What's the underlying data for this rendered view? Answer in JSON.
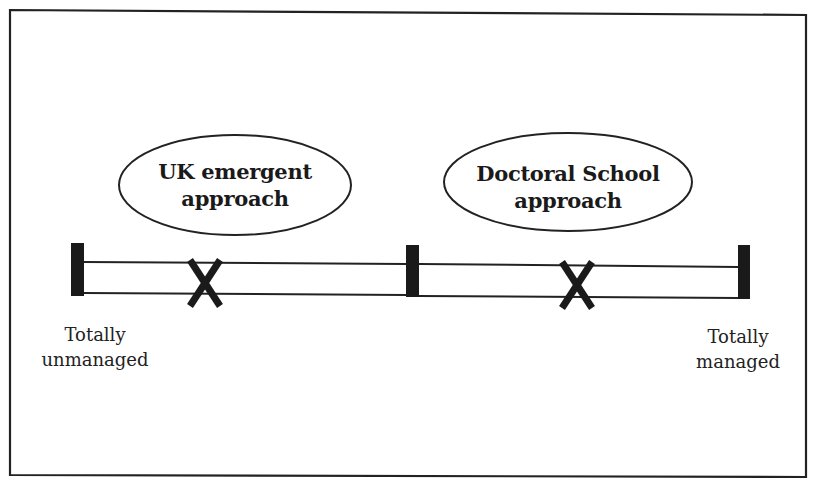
{
  "diagram": {
    "type": "continuum-scale",
    "colors": {
      "ink": "#1a1a1a",
      "background": "#ffffff"
    },
    "scale": {
      "left_label": [
        "Totally",
        "unmanaged"
      ],
      "right_label": [
        "Totally",
        "managed"
      ],
      "ticks": [
        "left-end",
        "midpoint",
        "right-end"
      ]
    },
    "markers": [
      {
        "symbol": "X",
        "label": [
          "UK emergent",
          "approach"
        ],
        "position_pct": 19
      },
      {
        "symbol": "X",
        "label": [
          "Doctoral School",
          "approach"
        ],
        "position_pct": 75
      }
    ]
  }
}
